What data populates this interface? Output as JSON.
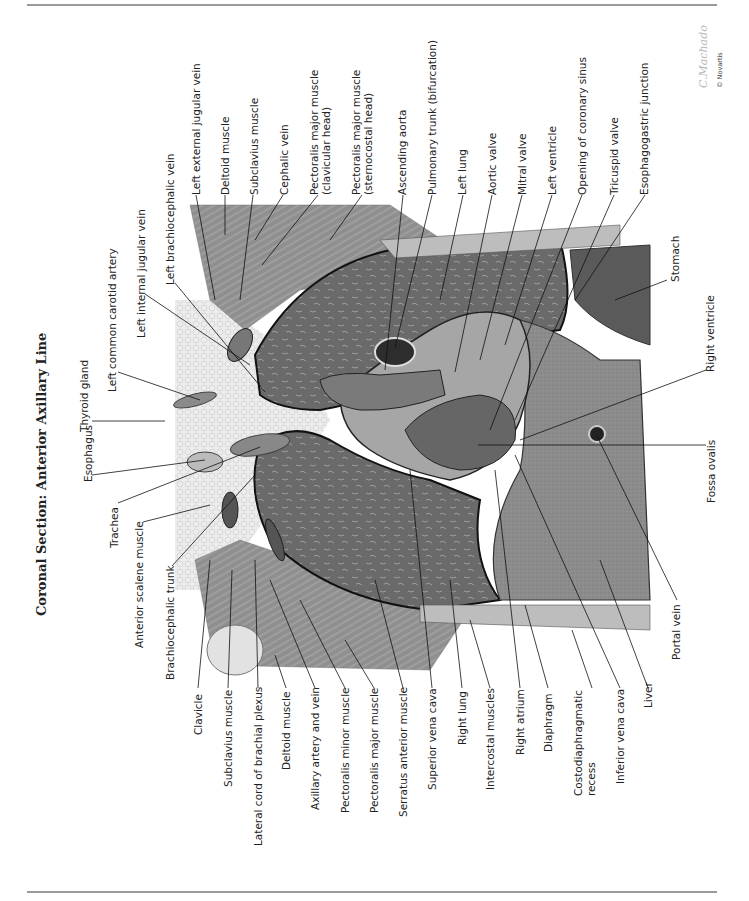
{
  "page": {
    "title": "Coronal Section: Anterior Axillary Line",
    "signature": "C.Machado",
    "copyright": "© Novartis"
  },
  "labels": {
    "left_column": {
      "thyroid_gland": "Thyroid gland",
      "esophagus": "Esophagus",
      "left_common_carotid_artery": "Left common carotid artery",
      "trachea": "Trachea",
      "left_internal_jugular_vein": "Left internal jugular vein",
      "anterior_scalene_muscle": "Anterior scalene muscle",
      "left_brachiocephalic_vein": "Left brachiocephalic vein",
      "brachiocephalic_trunk": "Brachiocephalic trunk"
    },
    "top_row": [
      "Left external jugular vein",
      "Deltoid muscle",
      "Subclavius muscle",
      "Cephalic vein",
      "Pectoralis major muscle",
      "(clavicular head)",
      "Pectoralis major muscle",
      "(sternocostal head)",
      "Ascending aorta",
      "Pulmonary trunk (bifurcation)",
      "Left lung",
      "Aortic valve",
      "Mitral valve",
      "Left ventricle",
      "Opening of coronary sinus",
      "Tricuspid valve",
      "Esophagogastric junction"
    ],
    "right_side": {
      "stomach": "Stomach",
      "right_ventricle": "Right ventricle",
      "fossa_ovalis": "Fossa ovalis",
      "portal_vein": "Portal vein"
    },
    "bottom_row": [
      "Clavicle",
      "Subclavius muscle",
      "Lateral cord of brachial plexus",
      "Deltoid muscle",
      "Axillary artery and vein",
      "Pectoralis minor muscle",
      "Pectoralis major muscle",
      "Serratus anterior muscle",
      "Superior vena cava",
      "Right lung",
      "Intercostal muscles",
      "Right atrium",
      "Diaphragm",
      "Costodiaphragmatic",
      "recess",
      "Inferior vena cava",
      "Liver"
    ]
  },
  "colors": {
    "rule": "#9a9a9a",
    "lung": "#6e6e6e",
    "liver": "#8a8a8a",
    "muscle": "#9c9c9c",
    "fat": "#e4e4e4",
    "vessel_dark": "#3a3a3a",
    "text": "#222222"
  }
}
